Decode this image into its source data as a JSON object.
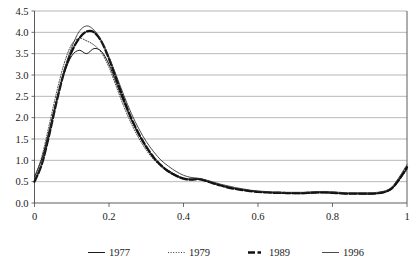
{
  "chart_data": {
    "type": "line",
    "title": "",
    "subtitle": "",
    "xlabel": "",
    "ylabel": "",
    "xlim": [
      0,
      1
    ],
    "ylim": [
      0,
      4.5
    ],
    "grid": "horizontal",
    "legend_position": "bottom",
    "y_ticks": [
      "0.0",
      "0.5",
      "1.0",
      "1.5",
      "2.0",
      "2.5",
      "3.0",
      "3.5",
      "4.0",
      "4.5"
    ],
    "y_tick_values": [
      0.0,
      0.5,
      1.0,
      1.5,
      2.0,
      2.5,
      3.0,
      3.5,
      4.0,
      4.5
    ],
    "x_ticks": [
      "0",
      "0.2",
      "0.4",
      "0.6",
      "0.8",
      "1"
    ],
    "x_tick_values": [
      0,
      0.2,
      0.4,
      0.6,
      0.8,
      1.0
    ],
    "x": [
      0.0,
      0.02,
      0.04,
      0.06,
      0.08,
      0.1,
      0.12,
      0.14,
      0.16,
      0.18,
      0.2,
      0.22,
      0.24,
      0.26,
      0.28,
      0.3,
      0.32,
      0.34,
      0.36,
      0.38,
      0.4,
      0.42,
      0.44,
      0.46,
      0.48,
      0.5,
      0.52,
      0.54,
      0.56,
      0.58,
      0.6,
      0.62,
      0.64,
      0.66,
      0.68,
      0.7,
      0.72,
      0.74,
      0.76,
      0.78,
      0.8,
      0.82,
      0.84,
      0.86,
      0.88,
      0.9,
      0.92,
      0.94,
      0.96,
      0.98,
      1.0
    ],
    "series": [
      {
        "name": "1977",
        "style": "solid-thin-dark",
        "color": "#1b1b1b",
        "values": [
          0.62,
          1.05,
          1.72,
          2.45,
          3.05,
          3.45,
          3.58,
          3.5,
          3.62,
          3.55,
          3.25,
          2.8,
          2.35,
          1.95,
          1.6,
          1.3,
          1.05,
          0.88,
          0.76,
          0.66,
          0.58,
          0.56,
          0.57,
          0.53,
          0.47,
          0.42,
          0.38,
          0.34,
          0.31,
          0.29,
          0.27,
          0.25,
          0.24,
          0.23,
          0.23,
          0.22,
          0.22,
          0.23,
          0.24,
          0.24,
          0.23,
          0.22,
          0.22,
          0.22,
          0.21,
          0.21,
          0.22,
          0.25,
          0.34,
          0.55,
          0.8
        ]
      },
      {
        "name": "1979",
        "style": "dotted",
        "color": "#3a3a3a",
        "values": [
          0.58,
          1.1,
          1.85,
          2.62,
          3.28,
          3.72,
          3.86,
          3.8,
          3.7,
          3.52,
          3.18,
          2.72,
          2.26,
          1.86,
          1.52,
          1.24,
          1.02,
          0.85,
          0.72,
          0.63,
          0.56,
          0.54,
          0.55,
          0.52,
          0.46,
          0.41,
          0.37,
          0.33,
          0.3,
          0.28,
          0.26,
          0.25,
          0.24,
          0.23,
          0.22,
          0.22,
          0.22,
          0.23,
          0.24,
          0.24,
          0.23,
          0.22,
          0.21,
          0.21,
          0.21,
          0.21,
          0.22,
          0.25,
          0.33,
          0.54,
          0.78
        ]
      },
      {
        "name": "1989",
        "style": "bold-dashed",
        "color": "#111111",
        "values": [
          0.5,
          0.92,
          1.62,
          2.4,
          3.08,
          3.55,
          3.86,
          4.02,
          4.0,
          3.78,
          3.38,
          2.9,
          2.42,
          1.98,
          1.62,
          1.32,
          1.07,
          0.88,
          0.74,
          0.64,
          0.57,
          0.55,
          0.56,
          0.52,
          0.46,
          0.41,
          0.36,
          0.33,
          0.3,
          0.28,
          0.26,
          0.25,
          0.24,
          0.24,
          0.23,
          0.23,
          0.23,
          0.24,
          0.25,
          0.25,
          0.24,
          0.23,
          0.22,
          0.22,
          0.22,
          0.22,
          0.23,
          0.26,
          0.35,
          0.57,
          0.84
        ]
      },
      {
        "name": "1996",
        "style": "solid-thin",
        "color": "#2b2b2b",
        "values": [
          0.55,
          0.95,
          1.65,
          2.42,
          3.12,
          3.65,
          4.02,
          4.15,
          4.05,
          3.8,
          3.42,
          2.98,
          2.52,
          2.1,
          1.74,
          1.44,
          1.2,
          1.0,
          0.86,
          0.74,
          0.65,
          0.6,
          0.58,
          0.54,
          0.49,
          0.44,
          0.4,
          0.36,
          0.33,
          0.3,
          0.28,
          0.27,
          0.26,
          0.25,
          0.25,
          0.25,
          0.25,
          0.26,
          0.27,
          0.27,
          0.26,
          0.25,
          0.24,
          0.24,
          0.24,
          0.24,
          0.25,
          0.28,
          0.38,
          0.62,
          0.9
        ]
      }
    ]
  },
  "legend": {
    "items": [
      {
        "label": "1977",
        "swatch": "legend-swatch-solid"
      },
      {
        "label": "1979",
        "swatch": "legend-swatch-dotted"
      },
      {
        "label": "1989",
        "swatch": "legend-swatch-bold"
      },
      {
        "label": "1996",
        "swatch": "legend-swatch-thin"
      }
    ]
  },
  "colors": {
    "gridline": "#9a9a9a",
    "axis": "#4a4a4a",
    "text": "#1b1b1b",
    "background": "#ffffff"
  }
}
